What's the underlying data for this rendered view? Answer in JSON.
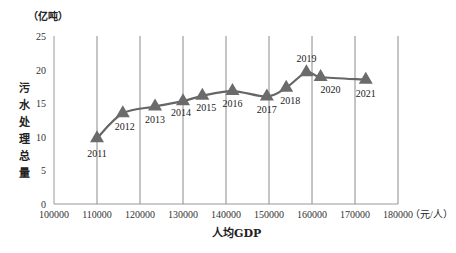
{
  "chart_data": {
    "type": "line",
    "title": "",
    "xlabel": "人均GDP",
    "x_unit": "（元/人）",
    "ylabel": "污水处理总量",
    "y_unit": "（亿吨）",
    "xlim": [
      100000,
      180000
    ],
    "ylim": [
      0,
      25
    ],
    "x_ticks": [
      "100000",
      "110000",
      "120000",
      "130000",
      "140000",
      "150000",
      "160000",
      "170000",
      "180000"
    ],
    "y_ticks": [
      "0",
      "5",
      "10",
      "15",
      "20",
      "25"
    ],
    "grid": "vertical",
    "marker": "triangle",
    "color": "#666666",
    "points": [
      {
        "year": "2011",
        "x": 110000,
        "y": 9.8
      },
      {
        "year": "2012",
        "x": 116000,
        "y": 13.5
      },
      {
        "year": "2013",
        "x": 123500,
        "y": 14.5
      },
      {
        "year": "2014",
        "x": 130000,
        "y": 15.3
      },
      {
        "year": "2015",
        "x": 134500,
        "y": 16.1
      },
      {
        "year": "2016",
        "x": 141500,
        "y": 16.8
      },
      {
        "year": "2017",
        "x": 149500,
        "y": 16.0
      },
      {
        "year": "2018",
        "x": 154000,
        "y": 17.3
      },
      {
        "year": "2019",
        "x": 158700,
        "y": 19.6
      },
      {
        "year": "2020",
        "x": 162000,
        "y": 18.9
      },
      {
        "year": "2021",
        "x": 172500,
        "y": 18.5
      }
    ]
  }
}
